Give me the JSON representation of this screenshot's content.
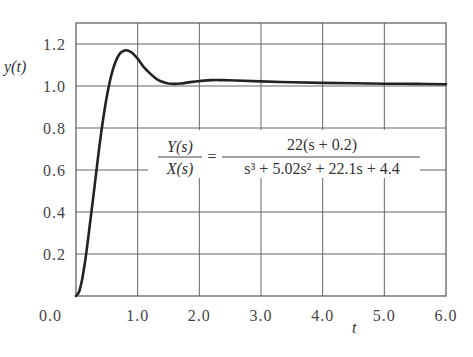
{
  "chart_data": {
    "type": "line",
    "title": "",
    "xlabel": "t",
    "ylabel": "y(t)",
    "xlim": [
      0,
      6
    ],
    "ylim": [
      0,
      1.3
    ],
    "grid": true,
    "x_ticks": [
      "0.0",
      "1.0",
      "2.0",
      "3.0",
      "4.0",
      "5.0",
      "6.0"
    ],
    "y_ticks": [
      "0.2",
      "0.4",
      "0.6",
      "0.8",
      "1.0",
      "1.2"
    ],
    "annotation": {
      "lhs_num": "Y(s)",
      "lhs_den": "X(s)",
      "equals": "=",
      "rhs_num": "22(s + 0.2)",
      "rhs_den": "s³ + 5.02s² + 22.1s + 4.4"
    },
    "series": [
      {
        "name": "step response",
        "x": [
          0,
          0.05,
          0.1,
          0.15,
          0.2,
          0.3,
          0.4,
          0.5,
          0.6,
          0.7,
          0.8,
          0.9,
          1.0,
          1.1,
          1.2,
          1.3,
          1.4,
          1.5,
          1.6,
          1.7,
          1.8,
          2.0,
          2.2,
          2.4,
          2.6,
          3.0,
          3.5,
          4.0,
          4.5,
          5.0,
          5.5,
          6.0
        ],
        "y": [
          0,
          0.02,
          0.08,
          0.17,
          0.28,
          0.52,
          0.76,
          0.95,
          1.08,
          1.15,
          1.17,
          1.16,
          1.13,
          1.09,
          1.06,
          1.035,
          1.02,
          1.012,
          1.01,
          1.012,
          1.016,
          1.024,
          1.028,
          1.028,
          1.026,
          1.022,
          1.018,
          1.015,
          1.013,
          1.011,
          1.01,
          1.008
        ]
      }
    ]
  }
}
